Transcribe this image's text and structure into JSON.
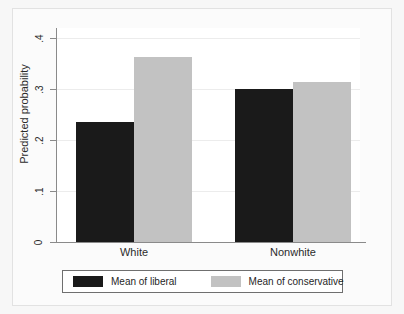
{
  "chart_data": {
    "type": "bar",
    "title": "",
    "xlabel": "",
    "ylabel": "Predicted probability",
    "categories": [
      "White",
      "Nonwhite"
    ],
    "series": [
      {
        "name": "Mean of liberal",
        "color": "#1a1a1a",
        "values": [
          0.235,
          0.3
        ]
      },
      {
        "name": "Mean of conservative",
        "color": "#c2c2c2",
        "values": [
          0.363,
          0.315
        ]
      }
    ],
    "ylim": [
      0,
      0.42
    ],
    "yticks": [
      0,
      0.1,
      0.2,
      0.3,
      0.4
    ],
    "ytick_labels": [
      "0",
      ".1",
      ".2",
      ".3",
      ".4"
    ],
    "grid": true,
    "legend_position": "bottom"
  },
  "legend": {
    "entries": [
      {
        "label": "Mean of liberal"
      },
      {
        "label": "Mean of conservative"
      }
    ]
  }
}
